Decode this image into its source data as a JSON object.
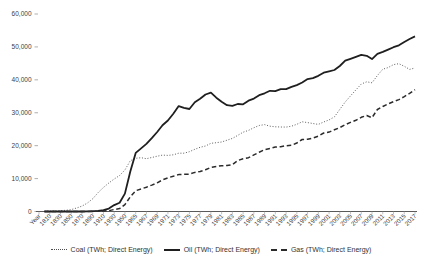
{
  "page": {
    "background": "#ffffff"
  },
  "chart_data": {
    "type": "line",
    "title": "",
    "grid": false,
    "legend_position": "bottom",
    "text_color": "#404040",
    "axis_color": "#595959",
    "x_axis_label_every": 2,
    "categories": [
      "Year",
      "1800",
      "1810",
      "1820",
      "1830",
      "1840",
      "1850",
      "1860",
      "1870",
      "1880",
      "1890",
      "1900",
      "1910",
      "1920",
      "1930",
      "1940",
      "1950",
      "1960",
      "1965",
      "1966",
      "1967",
      "1968",
      "1969",
      "1970",
      "1971",
      "1972",
      "1973",
      "1974",
      "1975",
      "1976",
      "1977",
      "1978",
      "1979",
      "1980",
      "1981",
      "1982",
      "1983",
      "1984",
      "1985",
      "1986",
      "1987",
      "1988",
      "1989",
      "1990",
      "1991",
      "1992",
      "1993",
      "1994",
      "1995",
      "1996",
      "1997",
      "1998",
      "1999",
      "2000",
      "2001",
      "2002",
      "2003",
      "2004",
      "2005",
      "2006",
      "2007",
      "2008",
      "2009",
      "2010",
      "2011",
      "2012",
      "2013",
      "2014",
      "2015",
      "2016",
      "2017"
    ],
    "y_axis": {
      "min": 0,
      "max": 60000,
      "tick_step": 10000,
      "tick_labels": [
        "0",
        "10,000",
        "20,000",
        "30,000",
        "40,000",
        "50,000",
        "60,000"
      ]
    },
    "series": [
      {
        "name": "Coal (TWh; Direct Energy)",
        "key": "coal",
        "style": "dotted",
        "color": "#4d4d4d",
        "values": [
          null,
          97,
          128,
          153,
          264,
          356,
          569,
          1061,
          1642,
          2542,
          3856,
          5728,
          7318,
          8656,
          9867,
          10931,
          12603,
          15442,
          16151,
          16332,
          16050,
          16410,
          16790,
          17133,
          17037,
          17222,
          17716,
          17720,
          18168,
          18886,
          19491,
          19900,
          20704,
          20902,
          21107,
          21650,
          22215,
          23128,
          24104,
          24640,
          25446,
          26119,
          26409,
          25905,
          25720,
          25661,
          25650,
          25903,
          26489,
          27243,
          27012,
          26739,
          26448,
          27189,
          27818,
          28736,
          31021,
          33257,
          35127,
          36944,
          38734,
          39392,
          39107,
          41307,
          43237,
          43724,
          44623,
          44913,
          44115,
          43180,
          43587
        ]
      },
      {
        "name": "Oil (TWh; Direct Energy)",
        "key": "oil",
        "style": "solid",
        "color": "#1f1f1f",
        "values": [
          null,
          0,
          0,
          0,
          0,
          0,
          0,
          1,
          6,
          33,
          89,
          181,
          397,
          889,
          1935,
          2668,
          5444,
          12159,
          17794,
          19155,
          20539,
          22271,
          24156,
          26214,
          27644,
          29726,
          32029,
          31517,
          31145,
          33169,
          34239,
          35530,
          36088,
          34564,
          33355,
          32285,
          32110,
          32669,
          32576,
          33646,
          34297,
          35344,
          35913,
          36669,
          36583,
          37171,
          37152,
          37862,
          38401,
          39200,
          40225,
          40539,
          41226,
          42154,
          42600,
          43000,
          44200,
          45800,
          46400,
          47000,
          47600,
          47300,
          46300,
          47900,
          48500,
          49200,
          49900,
          50500,
          51500,
          52400,
          53200
        ]
      },
      {
        "name": "Gas (TWh; Direct Energy)",
        "key": "gas",
        "style": "dashed",
        "color": "#2b2b2b",
        "values": [
          null,
          0,
          0,
          0,
          0,
          0,
          0,
          0,
          0,
          0,
          36,
          64,
          141,
          233,
          603,
          881,
          2092,
          4472,
          6304,
          6855,
          7370,
          8016,
          8723,
          9614,
          10231,
          10736,
          11197,
          11336,
          11330,
          11884,
          12164,
          12710,
          13400,
          13680,
          13910,
          13950,
          14250,
          15450,
          16050,
          16340,
          17190,
          18010,
          18760,
          19160,
          19610,
          19690,
          19980,
          20100,
          20810,
          21870,
          21920,
          22300,
          22900,
          23860,
          24130,
          24820,
          25480,
          26380,
          27070,
          27700,
          28620,
          29160,
          28500,
          31000,
          31900,
          32700,
          33400,
          34000,
          34900,
          35900,
          37000
        ]
      }
    ]
  }
}
